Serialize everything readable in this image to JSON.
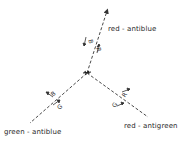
{
  "diagram": {
    "type": "gluon-color-vertex",
    "vertex": {
      "x": 87,
      "y": 73
    },
    "lines": [
      {
        "name": "red-antiblue",
        "end": {
          "x": 107,
          "y": 10
        },
        "arrow": true,
        "labels": [
          "B",
          "R"
        ]
      },
      {
        "name": "green-antiblue",
        "end": {
          "x": 30,
          "y": 123
        },
        "arrow": false,
        "labels": [
          "B",
          "G"
        ]
      },
      {
        "name": "red-antigreen",
        "end": {
          "x": 148,
          "y": 117
        },
        "arrow": false,
        "labels": [
          "R",
          "G"
        ]
      }
    ]
  },
  "labels": {
    "top": "red - antiblue",
    "left": "green - antiblue",
    "right": "red - antigreen",
    "top_b": "B",
    "top_r": "R",
    "left_b": "B",
    "left_g": "G",
    "right_r": "R",
    "right_g": "G"
  },
  "colors": {
    "line": "#333333",
    "text": "#2a2a2a",
    "background": "#ffffff"
  }
}
